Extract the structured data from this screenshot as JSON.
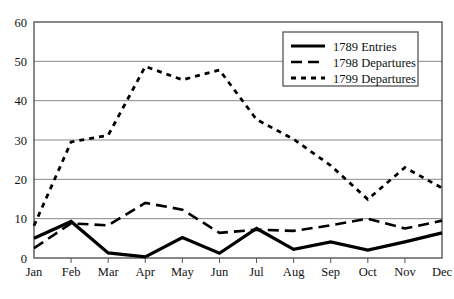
{
  "chart_data": {
    "type": "line",
    "title": "",
    "xlabel": "",
    "ylabel": "",
    "categories": [
      "Jan",
      "Feb",
      "Mar",
      "Apr",
      "May",
      "Jun",
      "Jul",
      "Aug",
      "Sep",
      "Oct",
      "Nov",
      "Dec"
    ],
    "ylim": [
      0,
      60
    ],
    "yticks": [
      0,
      10,
      20,
      30,
      40,
      50,
      60
    ],
    "grid": "horizontal",
    "legend_position": "top-right",
    "series": [
      {
        "name": "1789 Entries",
        "style": "solid",
        "color": "#000000",
        "values": [
          5,
          9.3,
          1.3,
          0.3,
          5.2,
          1.2,
          7.5,
          2.2,
          4.1,
          2.0,
          4.1,
          6.4
        ]
      },
      {
        "name": "1798 Departures",
        "style": "dashed",
        "color": "#000000",
        "values": [
          2.5,
          8.8,
          8.3,
          14.0,
          12.3,
          6.4,
          7.2,
          6.9,
          8.3,
          10.0,
          7.5,
          9.5
        ]
      },
      {
        "name": "1799 Departures",
        "style": "dotted",
        "color": "#000000",
        "values": [
          8.2,
          29.5,
          31.2,
          48.7,
          45.3,
          47.8,
          35.2,
          30.2,
          23.5,
          14.9,
          23.0,
          17.8
        ]
      }
    ]
  },
  "axis": {
    "ytick_labels": [
      "0",
      "10",
      "20",
      "30",
      "40",
      "50",
      "60"
    ],
    "xtick_labels": [
      "Jan",
      "Feb",
      "Mar",
      "Apr",
      "May",
      "Jun",
      "Jul",
      "Aug",
      "Sep",
      "Oct",
      "Nov",
      "Dec"
    ]
  },
  "legend": {
    "entries": [
      {
        "label": "1789 Entries",
        "swatch": "solid-line-swatch"
      },
      {
        "label": "1798 Departures",
        "swatch": "dashed-line-swatch"
      },
      {
        "label": "1799 Departures",
        "swatch": "dotted-line-swatch"
      }
    ]
  },
  "colors": {
    "ink": "#000000",
    "grid": "#888888",
    "frame": "#555555",
    "background": "#ffffff"
  }
}
